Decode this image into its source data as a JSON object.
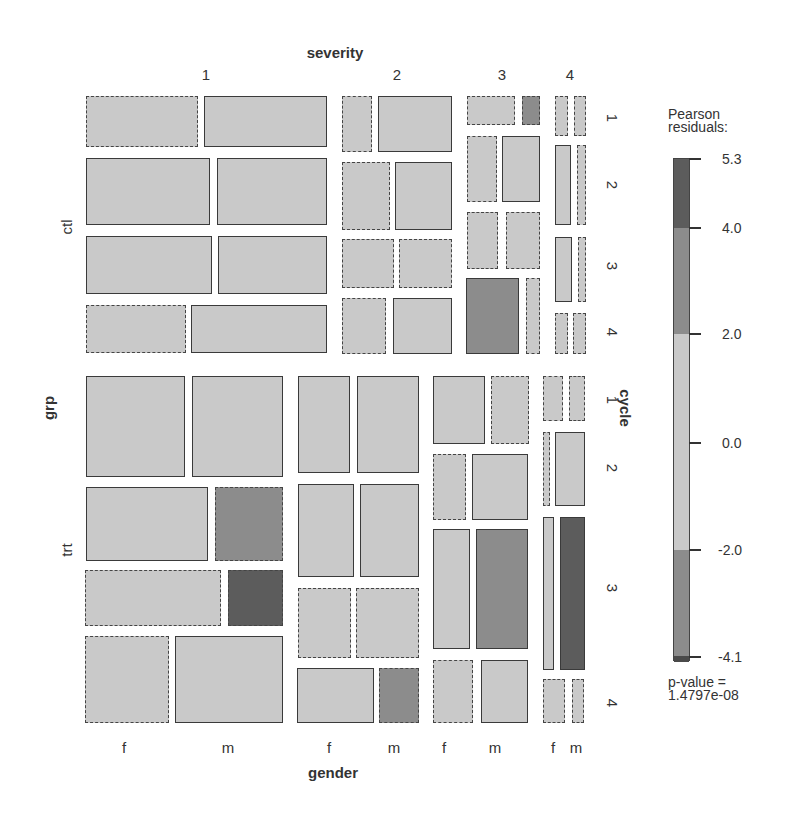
{
  "colors": {
    "neutral": "#c9c9c9",
    "medium": "#8c8c8c",
    "dark": "#5c5c5c",
    "darkest": "#4a4a4a"
  },
  "chart_data": {
    "type": "mosaic",
    "title_top": "severity",
    "title_bottom": "gender",
    "title_left": "grp",
    "title_right": "cycle",
    "variables": {
      "grp": [
        "ctl",
        "trt"
      ],
      "cycle": [
        "1",
        "2",
        "3",
        "4"
      ],
      "severity": [
        "1",
        "2",
        "3",
        "4"
      ],
      "gender": [
        "f",
        "m"
      ]
    },
    "legend": {
      "title_line1": "Pearson",
      "title_line2": "residuals:",
      "ticks": [
        "5.3",
        "4.0",
        "2.0",
        "0.0",
        "-2.0",
        "-4.1"
      ],
      "range": [
        -4.1,
        5.3
      ],
      "bands": [
        {
          "from": 4.0,
          "to": 5.3,
          "shade": "dark"
        },
        {
          "from": 2.0,
          "to": 4.0,
          "shade": "medium"
        },
        {
          "from": -2.0,
          "to": 2.0,
          "shade": "neutral"
        },
        {
          "from": -4.0,
          "to": -2.0,
          "shade": "medium"
        },
        {
          "from": -4.1,
          "to": -4.0,
          "shade": "dark"
        }
      ],
      "pvalue_line1": "p-value =",
      "pvalue_line2": "1.4797e-08"
    },
    "cell_encoding": "solid border = positive residual, dashed border = negative residual; fill shade by |residual| band",
    "cells": [
      {
        "grp": "ctl",
        "severity": "1",
        "cycle": "1",
        "gender": "f",
        "sign": "neg",
        "shade": "neutral",
        "box": [
          86,
          96,
          198,
          147
        ]
      },
      {
        "grp": "ctl",
        "severity": "1",
        "cycle": "1",
        "gender": "m",
        "sign": "pos",
        "shade": "neutral",
        "box": [
          204,
          96,
          327,
          147
        ]
      },
      {
        "grp": "ctl",
        "severity": "1",
        "cycle": "2",
        "gender": "f",
        "sign": "pos",
        "shade": "neutral",
        "box": [
          86,
          158,
          210,
          225
        ]
      },
      {
        "grp": "ctl",
        "severity": "1",
        "cycle": "2",
        "gender": "m",
        "sign": "pos",
        "shade": "neutral",
        "box": [
          217,
          158,
          327,
          225
        ]
      },
      {
        "grp": "ctl",
        "severity": "1",
        "cycle": "3",
        "gender": "f",
        "sign": "pos",
        "shade": "neutral",
        "box": [
          86,
          236,
          212,
          294
        ]
      },
      {
        "grp": "ctl",
        "severity": "1",
        "cycle": "3",
        "gender": "m",
        "sign": "pos",
        "shade": "neutral",
        "box": [
          218,
          236,
          327,
          294
        ]
      },
      {
        "grp": "ctl",
        "severity": "1",
        "cycle": "4",
        "gender": "f",
        "sign": "neg",
        "shade": "neutral",
        "box": [
          86,
          305,
          186,
          353
        ]
      },
      {
        "grp": "ctl",
        "severity": "1",
        "cycle": "4",
        "gender": "m",
        "sign": "pos",
        "shade": "neutral",
        "box": [
          191,
          305,
          327,
          353
        ]
      },
      {
        "grp": "ctl",
        "severity": "2",
        "cycle": "1",
        "gender": "f",
        "sign": "neg",
        "shade": "neutral",
        "box": [
          342,
          96,
          372,
          152
        ]
      },
      {
        "grp": "ctl",
        "severity": "2",
        "cycle": "1",
        "gender": "m",
        "sign": "pos",
        "shade": "neutral",
        "box": [
          378,
          96,
          452,
          152
        ]
      },
      {
        "grp": "ctl",
        "severity": "2",
        "cycle": "2",
        "gender": "f",
        "sign": "neg",
        "shade": "neutral",
        "box": [
          342,
          162,
          390,
          230
        ]
      },
      {
        "grp": "ctl",
        "severity": "2",
        "cycle": "2",
        "gender": "m",
        "sign": "pos",
        "shade": "neutral",
        "box": [
          395,
          162,
          452,
          230
        ]
      },
      {
        "grp": "ctl",
        "severity": "2",
        "cycle": "3",
        "gender": "f",
        "sign": "neg",
        "shade": "neutral",
        "box": [
          342,
          239,
          394,
          288
        ]
      },
      {
        "grp": "ctl",
        "severity": "2",
        "cycle": "3",
        "gender": "m",
        "sign": "neg",
        "shade": "neutral",
        "box": [
          399,
          239,
          452,
          288
        ]
      },
      {
        "grp": "ctl",
        "severity": "2",
        "cycle": "4",
        "gender": "f",
        "sign": "neg",
        "shade": "neutral",
        "box": [
          342,
          298,
          386,
          354
        ]
      },
      {
        "grp": "ctl",
        "severity": "2",
        "cycle": "4",
        "gender": "m",
        "sign": "pos",
        "shade": "neutral",
        "box": [
          393,
          298,
          452,
          354
        ]
      },
      {
        "grp": "ctl",
        "severity": "3",
        "cycle": "1",
        "gender": "f",
        "sign": "neg",
        "shade": "neutral",
        "box": [
          467,
          96,
          515,
          125
        ]
      },
      {
        "grp": "ctl",
        "severity": "3",
        "cycle": "1",
        "gender": "m",
        "sign": "neg",
        "shade": "medium",
        "box": [
          522,
          96,
          540,
          125
        ]
      },
      {
        "grp": "ctl",
        "severity": "3",
        "cycle": "2",
        "gender": "f",
        "sign": "neg",
        "shade": "neutral",
        "box": [
          467,
          136,
          497,
          202
        ]
      },
      {
        "grp": "ctl",
        "severity": "3",
        "cycle": "2",
        "gender": "m",
        "sign": "pos",
        "shade": "neutral",
        "box": [
          502,
          136,
          540,
          202
        ]
      },
      {
        "grp": "ctl",
        "severity": "3",
        "cycle": "3",
        "gender": "f",
        "sign": "neg",
        "shade": "neutral",
        "box": [
          467,
          212,
          498,
          269
        ]
      },
      {
        "grp": "ctl",
        "severity": "3",
        "cycle": "3",
        "gender": "m",
        "sign": "neg",
        "shade": "neutral",
        "box": [
          506,
          212,
          540,
          269
        ]
      },
      {
        "grp": "ctl",
        "severity": "3",
        "cycle": "4",
        "gender": "f",
        "sign": "pos",
        "shade": "medium",
        "box": [
          466,
          278,
          519,
          354
        ]
      },
      {
        "grp": "ctl",
        "severity": "3",
        "cycle": "4",
        "gender": "m",
        "sign": "neg",
        "shade": "neutral",
        "box": [
          526,
          278,
          540,
          354
        ]
      },
      {
        "grp": "ctl",
        "severity": "4",
        "cycle": "1",
        "gender": "f",
        "sign": "neg",
        "shade": "neutral",
        "box": [
          555,
          96,
          568,
          136
        ]
      },
      {
        "grp": "ctl",
        "severity": "4",
        "cycle": "1",
        "gender": "m",
        "sign": "neg",
        "shade": "neutral",
        "box": [
          574,
          96,
          586,
          136
        ]
      },
      {
        "grp": "ctl",
        "severity": "4",
        "cycle": "2",
        "gender": "f",
        "sign": "pos",
        "shade": "neutral",
        "box": [
          555,
          145,
          571,
          225
        ]
      },
      {
        "grp": "ctl",
        "severity": "4",
        "cycle": "2",
        "gender": "m",
        "sign": "neg",
        "shade": "neutral",
        "box": [
          577,
          145,
          586,
          225
        ]
      },
      {
        "grp": "ctl",
        "severity": "4",
        "cycle": "3",
        "gender": "f",
        "sign": "pos",
        "shade": "neutral",
        "box": [
          555,
          237,
          572,
          302
        ]
      },
      {
        "grp": "ctl",
        "severity": "4",
        "cycle": "3",
        "gender": "m",
        "sign": "neg",
        "shade": "neutral",
        "box": [
          578,
          237,
          586,
          302
        ]
      },
      {
        "grp": "ctl",
        "severity": "4",
        "cycle": "4",
        "gender": "f",
        "sign": "neg",
        "shade": "neutral",
        "box": [
          555,
          313,
          568,
          354
        ]
      },
      {
        "grp": "ctl",
        "severity": "4",
        "cycle": "4",
        "gender": "m",
        "sign": "neg",
        "shade": "neutral",
        "box": [
          573,
          313,
          586,
          354
        ]
      },
      {
        "grp": "trt",
        "severity": "1",
        "cycle": "1",
        "gender": "f",
        "sign": "pos",
        "shade": "neutral",
        "box": [
          86,
          376,
          185,
          477
        ]
      },
      {
        "grp": "trt",
        "severity": "1",
        "cycle": "1",
        "gender": "m",
        "sign": "pos",
        "shade": "neutral",
        "box": [
          192,
          376,
          283,
          477
        ]
      },
      {
        "grp": "trt",
        "severity": "1",
        "cycle": "2",
        "gender": "f",
        "sign": "pos",
        "shade": "neutral",
        "box": [
          86,
          487,
          208,
          561
        ]
      },
      {
        "grp": "trt",
        "severity": "1",
        "cycle": "2",
        "gender": "m",
        "sign": "neg",
        "shade": "medium",
        "box": [
          215,
          487,
          283,
          561
        ]
      },
      {
        "grp": "trt",
        "severity": "1",
        "cycle": "3",
        "gender": "f",
        "sign": "neg",
        "shade": "neutral",
        "box": [
          85,
          570,
          221,
          626
        ]
      },
      {
        "grp": "trt",
        "severity": "1",
        "cycle": "3",
        "gender": "m",
        "sign": "neg",
        "shade": "dark",
        "box": [
          228,
          570,
          283,
          626
        ]
      },
      {
        "grp": "trt",
        "severity": "1",
        "cycle": "4",
        "gender": "f",
        "sign": "neg",
        "shade": "neutral",
        "box": [
          85,
          636,
          169,
          723
        ]
      },
      {
        "grp": "trt",
        "severity": "1",
        "cycle": "4",
        "gender": "m",
        "sign": "pos",
        "shade": "neutral",
        "box": [
          175,
          636,
          283,
          723
        ]
      },
      {
        "grp": "trt",
        "severity": "2",
        "cycle": "1",
        "gender": "f",
        "sign": "pos",
        "shade": "neutral",
        "box": [
          298,
          376,
          350,
          473
        ]
      },
      {
        "grp": "trt",
        "severity": "2",
        "cycle": "1",
        "gender": "m",
        "sign": "pos",
        "shade": "neutral",
        "box": [
          357,
          376,
          419,
          473
        ]
      },
      {
        "grp": "trt",
        "severity": "2",
        "cycle": "2",
        "gender": "f",
        "sign": "pos",
        "shade": "neutral",
        "box": [
          298,
          484,
          354,
          577
        ]
      },
      {
        "grp": "trt",
        "severity": "2",
        "cycle": "2",
        "gender": "m",
        "sign": "pos",
        "shade": "neutral",
        "box": [
          360,
          484,
          419,
          577
        ]
      },
      {
        "grp": "trt",
        "severity": "2",
        "cycle": "3",
        "gender": "f",
        "sign": "neg",
        "shade": "neutral",
        "box": [
          298,
          588,
          351,
          658
        ]
      },
      {
        "grp": "trt",
        "severity": "2",
        "cycle": "3",
        "gender": "m",
        "sign": "neg",
        "shade": "neutral",
        "box": [
          356,
          588,
          419,
          658
        ]
      },
      {
        "grp": "trt",
        "severity": "2",
        "cycle": "4",
        "gender": "f",
        "sign": "pos",
        "shade": "neutral",
        "box": [
          297,
          668,
          374,
          723
        ]
      },
      {
        "grp": "trt",
        "severity": "2",
        "cycle": "4",
        "gender": "m",
        "sign": "neg",
        "shade": "medium",
        "box": [
          379,
          668,
          419,
          723
        ]
      },
      {
        "grp": "trt",
        "severity": "3",
        "cycle": "1",
        "gender": "f",
        "sign": "pos",
        "shade": "neutral",
        "box": [
          433,
          376,
          485,
          444
        ]
      },
      {
        "grp": "trt",
        "severity": "3",
        "cycle": "1",
        "gender": "m",
        "sign": "neg",
        "shade": "neutral",
        "box": [
          491,
          376,
          529,
          444
        ]
      },
      {
        "grp": "trt",
        "severity": "3",
        "cycle": "2",
        "gender": "f",
        "sign": "neg",
        "shade": "neutral",
        "box": [
          433,
          454,
          466,
          520
        ]
      },
      {
        "grp": "trt",
        "severity": "3",
        "cycle": "2",
        "gender": "m",
        "sign": "pos",
        "shade": "neutral",
        "box": [
          472,
          454,
          528,
          520
        ]
      },
      {
        "grp": "trt",
        "severity": "3",
        "cycle": "3",
        "gender": "f",
        "sign": "pos",
        "shade": "neutral",
        "box": [
          433,
          529,
          470,
          649
        ]
      },
      {
        "grp": "trt",
        "severity": "3",
        "cycle": "3",
        "gender": "m",
        "sign": "pos",
        "shade": "medium",
        "box": [
          476,
          529,
          528,
          649
        ]
      },
      {
        "grp": "trt",
        "severity": "3",
        "cycle": "4",
        "gender": "f",
        "sign": "neg",
        "shade": "neutral",
        "box": [
          433,
          660,
          473,
          723
        ]
      },
      {
        "grp": "trt",
        "severity": "3",
        "cycle": "4",
        "gender": "m",
        "sign": "pos",
        "shade": "neutral",
        "box": [
          481,
          660,
          528,
          723
        ]
      },
      {
        "grp": "trt",
        "severity": "4",
        "cycle": "1",
        "gender": "f",
        "sign": "neg",
        "shade": "neutral",
        "box": [
          543,
          376,
          563,
          421
        ]
      },
      {
        "grp": "trt",
        "severity": "4",
        "cycle": "1",
        "gender": "m",
        "sign": "neg",
        "shade": "neutral",
        "box": [
          569,
          376,
          585,
          421
        ]
      },
      {
        "grp": "trt",
        "severity": "4",
        "cycle": "2",
        "gender": "f",
        "sign": "neg",
        "shade": "neutral",
        "box": [
          543,
          432,
          550,
          506
        ]
      },
      {
        "grp": "trt",
        "severity": "4",
        "cycle": "2",
        "gender": "m",
        "sign": "pos",
        "shade": "neutral",
        "box": [
          555,
          432,
          585,
          506
        ]
      },
      {
        "grp": "trt",
        "severity": "4",
        "cycle": "3",
        "gender": "f",
        "sign": "pos",
        "shade": "neutral",
        "box": [
          543,
          517,
          554,
          670
        ]
      },
      {
        "grp": "trt",
        "severity": "4",
        "cycle": "3",
        "gender": "m",
        "sign": "pos",
        "shade": "dark",
        "box": [
          560,
          517,
          585,
          670
        ]
      },
      {
        "grp": "trt",
        "severity": "4",
        "cycle": "4",
        "gender": "f",
        "sign": "neg",
        "shade": "neutral",
        "box": [
          543,
          679,
          565,
          723
        ]
      },
      {
        "grp": "trt",
        "severity": "4",
        "cycle": "4",
        "gender": "m",
        "sign": "neg",
        "shade": "neutral",
        "box": [
          572,
          679,
          584,
          723
        ]
      }
    ]
  },
  "labels": {
    "top_title": {
      "text": "severity",
      "x": 335,
      "y": 52
    },
    "top_ticks": [
      {
        "text": "1",
        "x": 206,
        "y": 74
      },
      {
        "text": "2",
        "x": 397,
        "y": 74
      },
      {
        "text": "3",
        "x": 502,
        "y": 74
      },
      {
        "text": "4",
        "x": 570,
        "y": 74
      }
    ],
    "left_title": {
      "text": "grp",
      "x": 48,
      "y": 408
    },
    "left_ticks": [
      {
        "text": "ctl",
        "x": 66,
        "y": 227
      },
      {
        "text": "trt",
        "x": 66,
        "y": 550
      }
    ],
    "right_title": {
      "text": "cycle",
      "x": 625,
      "y": 408
    },
    "right_ticks": [
      {
        "text": "1",
        "x": 612,
        "y": 118
      },
      {
        "text": "2",
        "x": 612,
        "y": 185
      },
      {
        "text": "3",
        "x": 612,
        "y": 266
      },
      {
        "text": "4",
        "x": 612,
        "y": 332
      },
      {
        "text": "1",
        "x": 612,
        "y": 400
      },
      {
        "text": "2",
        "x": 612,
        "y": 468
      },
      {
        "text": "3",
        "x": 612,
        "y": 588
      },
      {
        "text": "4",
        "x": 612,
        "y": 703
      }
    ],
    "bottom_title": {
      "text": "gender",
      "x": 333,
      "y": 772
    },
    "bottom_ticks": [
      {
        "text": "f",
        "x": 124,
        "y": 747
      },
      {
        "text": "m",
        "x": 228,
        "y": 747
      },
      {
        "text": "f",
        "x": 329,
        "y": 747
      },
      {
        "text": "m",
        "x": 394,
        "y": 747
      },
      {
        "text": "f",
        "x": 444,
        "y": 747
      },
      {
        "text": "m",
        "x": 495,
        "y": 747
      },
      {
        "text": "f",
        "x": 553,
        "y": 747
      },
      {
        "text": "m",
        "x": 576,
        "y": 747
      }
    ]
  },
  "legend_layout": {
    "bar": {
      "x": 673,
      "top": 158,
      "width": 17,
      "bottom": 661
    },
    "tick_y": [
      158,
      227,
      333,
      442,
      549,
      656
    ],
    "band_y": [
      {
        "top": 158,
        "bottom": 227,
        "shade": "dark"
      },
      {
        "top": 227,
        "bottom": 333,
        "shade": "medium"
      },
      {
        "top": 333,
        "bottom": 549,
        "shade": "neutral"
      },
      {
        "top": 549,
        "bottom": 655,
        "shade": "medium"
      },
      {
        "top": 655,
        "bottom": 661,
        "shade": "darkest"
      }
    ]
  }
}
